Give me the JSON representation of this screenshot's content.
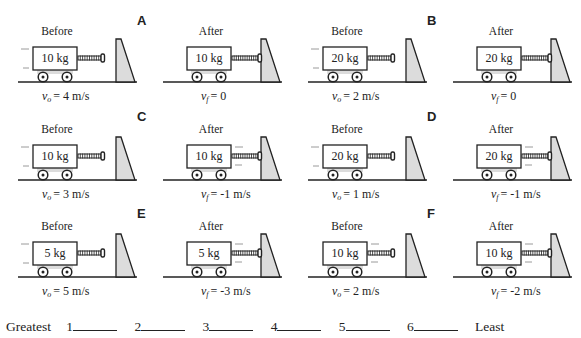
{
  "cases": [
    {
      "letter": "A",
      "mass": "10 kg",
      "before": {
        "label": "Before",
        "vel_symbol": "v",
        "vel_sub": "o",
        "vel_text": "= 4 m/s",
        "motion": "left"
      },
      "after": {
        "label": "After",
        "vel_symbol": "v",
        "vel_sub": "f",
        "vel_text": "= 0",
        "motion": "none"
      }
    },
    {
      "letter": "B",
      "mass": "20 kg",
      "before": {
        "label": "Before",
        "vel_symbol": "v",
        "vel_sub": "o",
        "vel_text": "= 2 m/s",
        "motion": "left"
      },
      "after": {
        "label": "After",
        "vel_symbol": "v",
        "vel_sub": "f",
        "vel_text": "= 0",
        "motion": "none"
      }
    },
    {
      "letter": "C",
      "mass": "10 kg",
      "before": {
        "label": "Before",
        "vel_symbol": "v",
        "vel_sub": "o",
        "vel_text": "= 3 m/s",
        "motion": "left"
      },
      "after": {
        "label": "After",
        "vel_symbol": "v",
        "vel_sub": "f",
        "vel_text": "= -1 m/s",
        "motion": "right"
      }
    },
    {
      "letter": "D",
      "mass": "20 kg",
      "before": {
        "label": "Before",
        "vel_symbol": "v",
        "vel_sub": "o",
        "vel_text": "= 1 m/s",
        "motion": "left"
      },
      "after": {
        "label": "After",
        "vel_symbol": "v",
        "vel_sub": "f",
        "vel_text": "= -1 m/s",
        "motion": "right"
      }
    },
    {
      "letter": "E",
      "mass": "5 kg",
      "before": {
        "label": "Before",
        "vel_symbol": "v",
        "vel_sub": "o",
        "vel_text": "= 5 m/s",
        "motion": "left"
      },
      "after": {
        "label": "After",
        "vel_symbol": "v",
        "vel_sub": "f",
        "vel_text": "= -3 m/s",
        "motion": "right"
      }
    },
    {
      "letter": "F",
      "mass": "10 kg",
      "before": {
        "label": "Before",
        "vel_symbol": "v",
        "vel_sub": "o",
        "vel_text": "= 2 m/s",
        "motion": "right"
      },
      "after": {
        "label": "After",
        "vel_symbol": "v",
        "vel_sub": "f",
        "vel_text": "= -2 m/s",
        "motion": "right"
      }
    }
  ],
  "ranking": {
    "start_label": "Greatest",
    "slots": [
      "1",
      "2",
      "3",
      "4",
      "5",
      "6"
    ],
    "end_label": "Least"
  },
  "colors": {
    "line": "#222222",
    "fill_gray": "#dcdcdc",
    "motion_line": "#9a9a9a"
  }
}
